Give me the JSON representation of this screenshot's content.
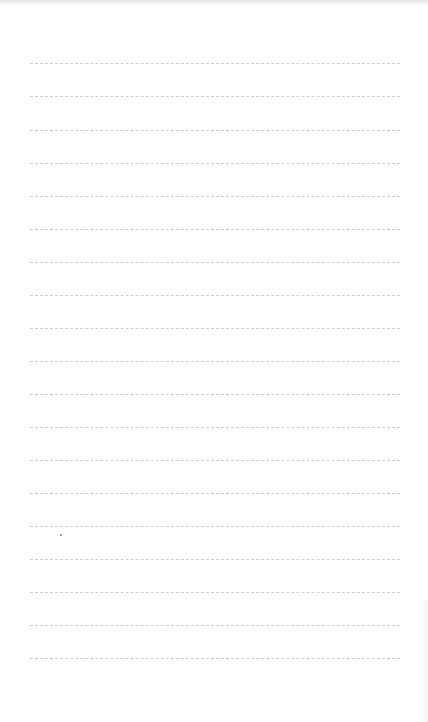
{
  "page": {
    "type": "lined-notebook-paper",
    "background_color": "#ffffff",
    "line_color": "#cfcfcf",
    "line_style": "dashed",
    "line_count": 19,
    "line_x_start": 30,
    "line_x_end": 400,
    "line_y_positions": [
      63,
      96,
      130,
      163,
      196,
      229,
      262,
      295,
      328,
      361,
      394,
      427,
      460,
      493,
      526,
      559,
      592,
      625,
      658
    ]
  },
  "marks": [
    {
      "name": "ink-speck",
      "x": 60,
      "y": 534,
      "color": "#8a8a8a"
    }
  ]
}
